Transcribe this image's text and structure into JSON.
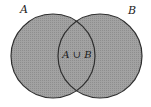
{
  "diagram": {
    "type": "venn",
    "sets": [
      {
        "name": "A",
        "label": "A"
      },
      {
        "name": "B",
        "label": "B"
      }
    ],
    "region_label": "A ∪ B",
    "shaded": "union",
    "colors": {
      "fill": "#9c9c9c",
      "stroke": "#2e2e2e",
      "background": "#ffffff"
    }
  }
}
